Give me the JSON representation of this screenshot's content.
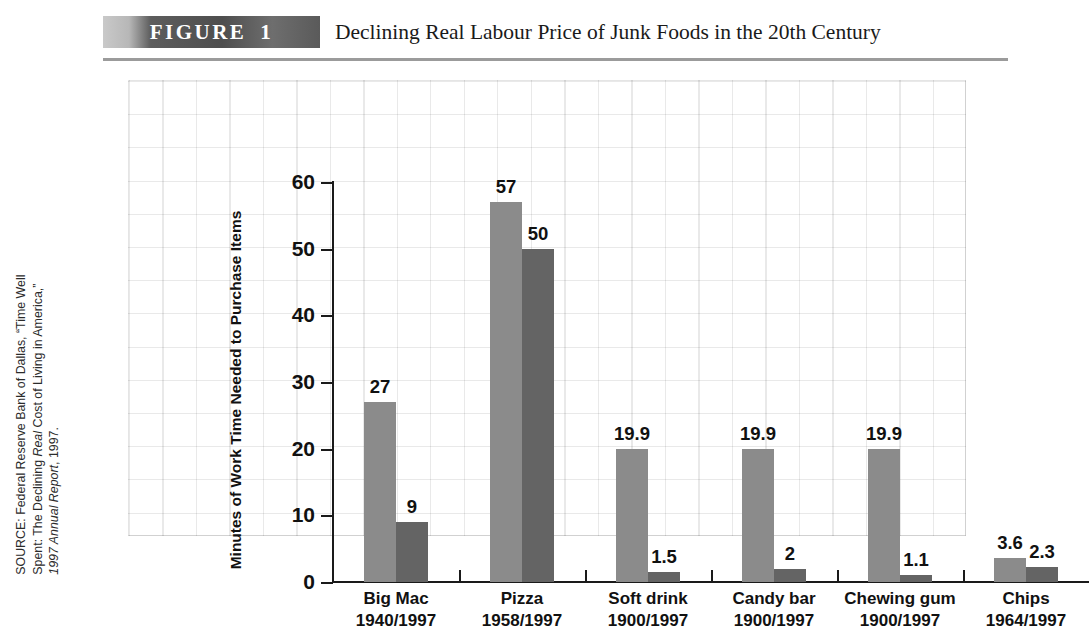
{
  "header": {
    "badge_word": "FIGURE",
    "badge_number": "1",
    "title": "Declining Real Labour Price of Junk Foods in the 20th Century"
  },
  "source_note": {
    "line1": "SOURCE: Federal Reserve Bank of Dallas, “Time Well",
    "line2_a": "Spent: The Declining ",
    "line2_b": "Real",
    "line2_c": " Cost of Living in America,”",
    "line3_a": "1997 Annual Report",
    "line3_b": ", 1997."
  },
  "chart_data": {
    "type": "bar",
    "title": "Declining Real Labour Price of Junk Foods in the 20th Century",
    "xlabel": "",
    "ylabel": "Minutes of Work Time Needed to Purchase Items",
    "ylim": [
      0,
      60
    ],
    "yticks": [
      "0",
      "10",
      "20",
      "30",
      "40",
      "50",
      "60"
    ],
    "grid": true,
    "legend": "none",
    "categories": [
      {
        "name": "Big Mac",
        "years": "1940/1997"
      },
      {
        "name": "Pizza",
        "years": "1958/1997"
      },
      {
        "name": "Soft drink",
        "years": "1900/1997"
      },
      {
        "name": "Candy bar",
        "years": "1900/1997"
      },
      {
        "name": "Chewing gum",
        "years": "1900/1997"
      },
      {
        "name": "Chips",
        "years": "1964/1997"
      }
    ],
    "series": [
      {
        "name": "Earlier year",
        "values": [
          27,
          57,
          19.9,
          19.9,
          19.9,
          3.6
        ],
        "labels": [
          "27",
          "57",
          "19.9",
          "19.9",
          "19.9",
          "3.6"
        ],
        "color": "#8b8b8b"
      },
      {
        "name": "1997",
        "values": [
          9,
          50,
          1.5,
          2,
          1.1,
          2.3
        ],
        "labels": [
          "9",
          "50",
          "1.5",
          "2",
          "1.1",
          "2.3"
        ],
        "color": "#646464"
      }
    ]
  }
}
